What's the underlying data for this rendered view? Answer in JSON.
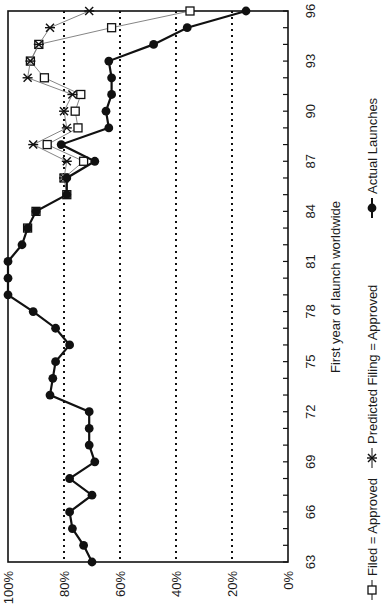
{
  "chart_data": {
    "type": "line",
    "orientation": "rotated-90-clockwise",
    "title": "",
    "xlabel": "First year of launch worldwide",
    "ylabel": "",
    "x_ticks": [
      "63",
      "66",
      "69",
      "72",
      "75",
      "78",
      "81",
      "84",
      "87",
      "90",
      "93",
      "96"
    ],
    "y_ticks": [
      "0%",
      "20%",
      "40%",
      "60%",
      "80%",
      "100%"
    ],
    "xlim": [
      63,
      96
    ],
    "ylim": [
      0,
      100
    ],
    "grid": {
      "y_dotted_at": [
        20,
        40,
        60,
        80
      ]
    },
    "legend": {
      "position": "bottom",
      "entries": [
        "Filed = Approved",
        "Predicted Filing = Approved",
        "Actual Launches"
      ]
    },
    "series": [
      {
        "name": "Actual Launches",
        "marker": "filled-circle",
        "line": "thick",
        "x": [
          63,
          64,
          65,
          66,
          67,
          68,
          69,
          70,
          71,
          72,
          73,
          74,
          75,
          76,
          77,
          78,
          79,
          80,
          81,
          82,
          83,
          84,
          85,
          86,
          87,
          88,
          89,
          90,
          91,
          92,
          93,
          94,
          95,
          96
        ],
        "values": [
          70,
          73,
          77,
          78,
          70,
          78,
          69,
          71,
          71,
          71,
          85,
          84,
          83,
          78,
          83,
          91,
          100,
          100,
          100,
          95,
          93,
          90,
          79,
          79,
          69,
          81,
          64,
          65,
          63,
          63,
          64,
          48,
          36,
          15
        ]
      },
      {
        "name": "Filed = Approved",
        "marker": "open-square",
        "line": "thin",
        "x": [
          83,
          84,
          85,
          86,
          87,
          88,
          89,
          90,
          91,
          92,
          93,
          94,
          95,
          96
        ],
        "values": [
          93,
          90,
          79,
          80,
          73,
          86,
          75,
          76,
          74,
          87,
          92,
          89,
          63,
          35
        ]
      },
      {
        "name": "Predicted Filing = Approved",
        "marker": "asterisk",
        "line": "thin",
        "x": [
          86,
          87,
          88,
          89,
          90,
          91,
          92,
          93,
          94,
          95,
          96
        ],
        "values": [
          80,
          79,
          91,
          79,
          80,
          77,
          93,
          92,
          89,
          85,
          71
        ]
      }
    ]
  },
  "colors": {
    "ink": "#111111",
    "thin_line": "#777777",
    "background": "#ffffff"
  }
}
